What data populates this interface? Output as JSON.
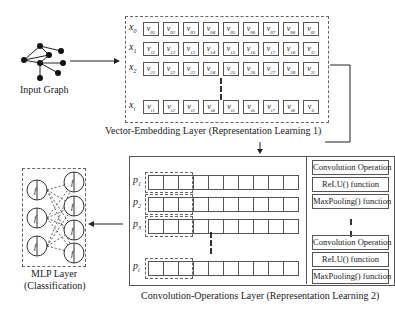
{
  "input_graph": {
    "label": "Input Graph"
  },
  "embedding_layer": {
    "caption": "Vector-Embedding Layer (Representation Learning 1)",
    "rows": [
      {
        "label": "x",
        "sub": "0",
        "cells": [
          "01",
          "02",
          "03",
          "04",
          "05",
          "06",
          "07",
          "08",
          "0l"
        ]
      },
      {
        "label": "x",
        "sub": "1",
        "cells": [
          "11",
          "12",
          "13",
          "14",
          "15",
          "16",
          "17",
          "18",
          "1l"
        ]
      },
      {
        "label": "x",
        "sub": "2",
        "cells": [
          "21",
          "22",
          "23",
          "24",
          "25",
          "26",
          "27",
          "28",
          "2l"
        ]
      },
      {
        "label": "x",
        "sub": "i",
        "cells": [
          "i1",
          "i2",
          "i3",
          "i4",
          "i5",
          "i6",
          "i7",
          "i8",
          "il"
        ]
      }
    ],
    "cell_symbol": "v"
  },
  "convolution_layer": {
    "caption": "Convolution-Operations Layer (Representation Learning 2)",
    "rows": [
      {
        "label": "p",
        "sub": "1"
      },
      {
        "label": "p",
        "sub": "2"
      },
      {
        "label": "p",
        "sub": "3"
      },
      {
        "label": "p",
        "sub": "i"
      }
    ],
    "operations": [
      "Convolution Operation",
      "ReLU() function",
      "MaxPooling() function",
      "Convolution Operation",
      "ReLU() function",
      "MaxPooling() function"
    ]
  },
  "mlp_layer": {
    "caption_line1": "MLP Layer",
    "caption_line2": "(Classification)",
    "neuron_symbol": "f"
  }
}
